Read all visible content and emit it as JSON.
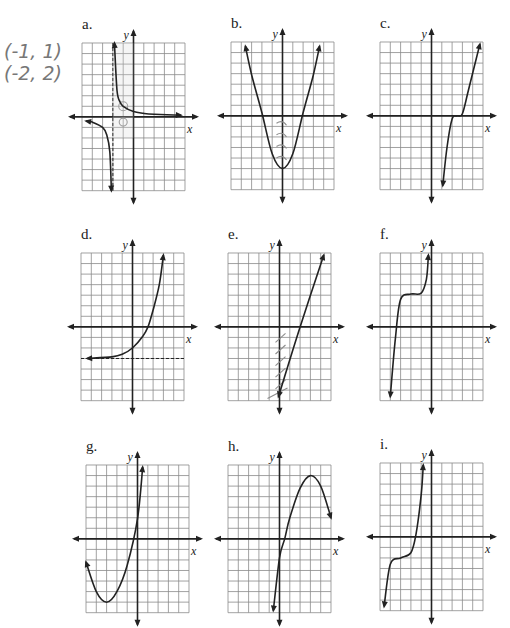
{
  "page": {
    "background": "#ffffff",
    "grid_color": "#8a8a8a",
    "axis_color": "#222222",
    "curve_color": "#222222",
    "pencil_color": "#8c8c8c"
  },
  "handwritten_note": {
    "lines": [
      "(-1, 1)",
      "(-2, 2)"
    ]
  },
  "chart_data": [
    {
      "id": "a",
      "label": "a.",
      "type": "line",
      "title": "a.",
      "xlabel": "x",
      "ylabel": "y",
      "grid": true,
      "xlim": [
        -5,
        5
      ],
      "ylim": [
        -7,
        7
      ],
      "description": "Rational function with vertical asymptote x = -2 (dashed) and horizontal asymptote y = 0",
      "asymptotes": {
        "vertical": [
          -2
        ],
        "horizontal": [
          0
        ]
      },
      "series": [
        {
          "name": "right branch",
          "points": [
            [
              -1.85,
              7
            ],
            [
              -1.6,
              2.5
            ],
            [
              -1.3,
              1.4
            ],
            [
              -1,
              1
            ],
            [
              0,
              0.5
            ],
            [
              1,
              0.33
            ],
            [
              2,
              0.25
            ],
            [
              4.6,
              0.15
            ]
          ]
        },
        {
          "name": "left branch",
          "points": [
            [
              -4.6,
              -0.4
            ],
            [
              -4,
              -0.5
            ],
            [
              -3,
              -1
            ],
            [
              -2.6,
              -1.7
            ],
            [
              -2.3,
              -3.3
            ],
            [
              -2.15,
              -7
            ]
          ]
        }
      ],
      "annotations": [
        "pencil circles at (-1, 1) and (-1, -0.5)"
      ]
    },
    {
      "id": "b",
      "label": "b.",
      "type": "line",
      "title": "b.",
      "xlabel": "x",
      "ylabel": "y",
      "grid": true,
      "xlim": [
        -5,
        5
      ],
      "ylim": [
        -7,
        7
      ],
      "description": "Upward parabola with vertex (0, -5)",
      "series": [
        {
          "name": "parabola",
          "points": [
            [
              -3.6,
              6.6
            ],
            [
              -3,
              3.9
            ],
            [
              -2,
              0.3
            ],
            [
              -1,
              -3.6
            ],
            [
              0,
              -5
            ],
            [
              1,
              -3.6
            ],
            [
              2,
              0.3
            ],
            [
              3,
              3.9
            ],
            [
              3.6,
              6.6
            ]
          ]
        }
      ],
      "annotations": [
        "pencil hatch marks along the negative y-axis"
      ]
    },
    {
      "id": "c",
      "label": "c.",
      "type": "line",
      "title": "c.",
      "xlabel": "x",
      "ylabel": "y",
      "grid": true,
      "xlim": [
        -5,
        5
      ],
      "ylim": [
        -7,
        7
      ],
      "description": "Cubic-like curve with flat section near (2.5, 0)",
      "series": [
        {
          "name": "cubic",
          "points": [
            [
              1.1,
              -6.6
            ],
            [
              1.5,
              -3
            ],
            [
              2,
              -0.3
            ],
            [
              2.5,
              0
            ],
            [
              3,
              0.2
            ],
            [
              3.6,
              2.5
            ],
            [
              4.7,
              6.8
            ]
          ]
        }
      ]
    },
    {
      "id": "d",
      "label": "d.",
      "type": "line",
      "title": "d.",
      "xlabel": "x",
      "ylabel": "y",
      "grid": true,
      "xlim": [
        -5,
        5
      ],
      "ylim": [
        -7,
        7
      ],
      "description": "Exponential growth with horizontal asymptote y = -3 (dashed)",
      "asymptotes": {
        "horizontal": [
          -3
        ]
      },
      "series": [
        {
          "name": "exponential",
          "points": [
            [
              -4.4,
              -3
            ],
            [
              -2,
              -2.85
            ],
            [
              -1,
              -2.6
            ],
            [
              0,
              -2
            ],
            [
              1,
              -0.9
            ],
            [
              1.5,
              0
            ],
            [
              2,
              1.6
            ],
            [
              2.6,
              4
            ],
            [
              3,
              6.8
            ]
          ]
        }
      ]
    },
    {
      "id": "e",
      "label": "e.",
      "type": "line",
      "title": "e.",
      "xlabel": "x",
      "ylabel": "y",
      "grid": true,
      "xlim": [
        -5,
        5
      ],
      "ylim": [
        -7,
        7
      ],
      "description": "Straight line with positive slope, y-intercept near -6, x-intercept near 2",
      "series": [
        {
          "name": "line",
          "points": [
            [
              -0.1,
              -6.6
            ],
            [
              2,
              0
            ],
            [
              4.3,
              6.8
            ]
          ]
        }
      ],
      "annotations": [
        "pencil hatch marks along the negative y-axis"
      ]
    },
    {
      "id": "f",
      "label": "f.",
      "type": "line",
      "title": "f.",
      "xlabel": "x",
      "ylabel": "y",
      "grid": true,
      "xlim": [
        -5,
        5
      ],
      "ylim": [
        -7,
        7
      ],
      "description": "Cubic-like curve with flat section near (-1.5, 3)",
      "series": [
        {
          "name": "cubic",
          "points": [
            [
              -4,
              -6.6
            ],
            [
              -3.5,
              -1
            ],
            [
              -3,
              2.6
            ],
            [
              -2,
              3.1
            ],
            [
              -1,
              3.2
            ],
            [
              -0.5,
              4.5
            ],
            [
              -0.3,
              6.8
            ]
          ]
        }
      ]
    },
    {
      "id": "g",
      "label": "g.",
      "type": "line",
      "title": "g.",
      "xlabel": "x",
      "ylabel": "y",
      "grid": true,
      "xlim": [
        -5,
        5
      ],
      "ylim": [
        -7,
        7
      ],
      "description": "Upward parabola with vertex near (-3, -6)",
      "series": [
        {
          "name": "parabola",
          "points": [
            [
              -5,
              -2.2
            ],
            [
              -4,
              -5
            ],
            [
              -3,
              -6
            ],
            [
              -2,
              -5
            ],
            [
              -1,
              -2.5
            ],
            [
              0,
              1.9
            ],
            [
              0.5,
              6.8
            ]
          ]
        }
      ]
    },
    {
      "id": "h",
      "label": "h.",
      "type": "line",
      "title": "h.",
      "xlabel": "x",
      "ylabel": "y",
      "grid": true,
      "xlim": [
        -5,
        5
      ],
      "ylim": [
        -7,
        7
      ],
      "description": "Downward parabola with vertex near (3, 6)",
      "series": [
        {
          "name": "parabola",
          "points": [
            [
              -0.6,
              -6.8
            ],
            [
              0,
              -1.8
            ],
            [
              0.5,
              0
            ],
            [
              1,
              2
            ],
            [
              2,
              4.8
            ],
            [
              3,
              6
            ],
            [
              4,
              5
            ],
            [
              5,
              2
            ]
          ]
        }
      ]
    },
    {
      "id": "i",
      "label": "i.",
      "type": "line",
      "title": "i.",
      "xlabel": "x",
      "ylabel": "y",
      "grid": true,
      "xlim": [
        -5,
        5
      ],
      "ylim": [
        -7,
        7
      ],
      "description": "Cubic-like curve with flat section near (-3, -2)",
      "series": [
        {
          "name": "cubic",
          "points": [
            [
              -4.6,
              -6.6
            ],
            [
              -4,
              -2.6
            ],
            [
              -3,
              -2
            ],
            [
              -2,
              -1.5
            ],
            [
              -1.5,
              0.3
            ],
            [
              -1,
              4
            ],
            [
              -0.8,
              6.8
            ]
          ]
        }
      ]
    }
  ],
  "panels": [
    {
      "id": "a",
      "label": "a.",
      "left": 82,
      "top": 43
    },
    {
      "id": "b",
      "label": "b.",
      "left": 231,
      "top": 42
    },
    {
      "id": "c",
      "label": "c.",
      "left": 380,
      "top": 42
    },
    {
      "id": "d",
      "label": "d.",
      "left": 81,
      "top": 253
    },
    {
      "id": "e",
      "label": "e.",
      "left": 228,
      "top": 253
    },
    {
      "id": "f",
      "label": "f.",
      "left": 380,
      "top": 253
    },
    {
      "id": "g",
      "label": "g.",
      "left": 86,
      "top": 465
    },
    {
      "id": "h",
      "label": "h.",
      "left": 228,
      "top": 465
    },
    {
      "id": "i",
      "label": "i.",
      "left": 380,
      "top": 463
    }
  ]
}
